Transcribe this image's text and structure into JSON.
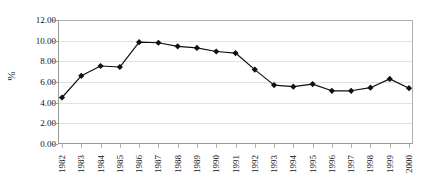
{
  "figure": {
    "scan_artifact_text": "",
    "plot": {
      "background": "#ffffff",
      "frame_color": "#9a9a9a",
      "gridline_color": "#e2e2e2"
    }
  },
  "chart_data": {
    "type": "line",
    "title": "",
    "xlabel": "",
    "ylabel": "%",
    "categories": [
      "1982",
      "1983",
      "1984",
      "1985",
      "1986",
      "1987",
      "1988",
      "1989",
      "1990",
      "1991",
      "1992",
      "1993",
      "1994",
      "1995",
      "1996",
      "1997",
      "1998",
      "1999",
      "2000"
    ],
    "values": [
      4.5,
      6.6,
      7.55,
      7.45,
      9.85,
      9.8,
      9.45,
      9.3,
      8.95,
      8.8,
      7.2,
      5.7,
      5.55,
      5.8,
      5.15,
      5.15,
      5.45,
      6.3,
      5.4
    ],
    "ylim": [
      0,
      12
    ],
    "ytick_values": [
      0,
      2,
      4,
      6,
      8,
      10,
      12
    ],
    "ytick_labels": [
      "0.00",
      "2.00",
      "4.00",
      "6.00",
      "8.00",
      "10.00",
      "12.00"
    ],
    "grid": true,
    "grid_axis": "y",
    "legend": false,
    "legend_position": "none",
    "marker": "diamond",
    "marker_color": "#111111",
    "line_color": "#111111",
    "line_width": 1.2,
    "xtick_rotation": -90
  }
}
